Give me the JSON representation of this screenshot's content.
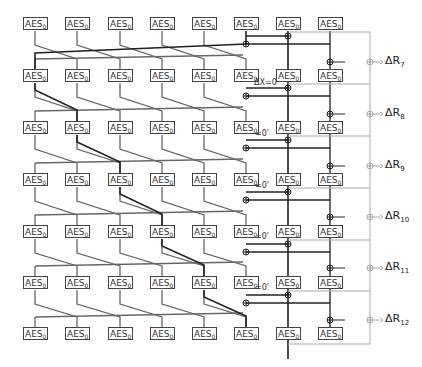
{
  "diagram": {
    "box_label": "AES",
    "box_subscript": "0",
    "columns_x": [
      35,
      77,
      120,
      162,
      204,
      246,
      288,
      330
    ],
    "rows_y": [
      24,
      76,
      128,
      180,
      232,
      283,
      334
    ],
    "outputs": [
      {
        "label": "ΔR",
        "sub": "7",
        "y": 62
      },
      {
        "label": "ΔR",
        "sub": "8",
        "y": 114
      },
      {
        "label": "ΔR",
        "sub": "9",
        "y": 166
      },
      {
        "label": "ΔR",
        "sub": "10",
        "y": 217
      },
      {
        "label": "ΔR",
        "sub": "11",
        "y": 268
      },
      {
        "label": "ΔR",
        "sub": "12",
        "y": 320
      }
    ],
    "annotations": [
      {
        "text": "ΔX=0",
        "x": 254,
        "y": 84
      },
      {
        "text": "=0'",
        "x": 255,
        "y": 135
      },
      {
        "text": "=0'",
        "x": 255,
        "y": 187
      },
      {
        "text": "=0'",
        "x": 255,
        "y": 238
      },
      {
        "text": "=0'",
        "x": 255,
        "y": 289
      }
    ],
    "colors": {
      "dark": "#222222",
      "mid": "#666666",
      "light": "#aaaaaa"
    }
  }
}
